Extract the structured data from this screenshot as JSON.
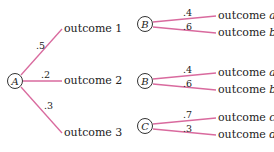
{
  "colors": {
    "branch": "#d96a9e",
    "text": "#222222",
    "node_border": "#333333"
  },
  "tree_A": {
    "node": "A",
    "branches": [
      {
        "prob": ".5",
        "outcome": "outcome 1"
      },
      {
        "prob": ".2",
        "outcome": "outcome 2"
      },
      {
        "prob": ".3",
        "outcome": "outcome 3"
      }
    ]
  },
  "tree_B1": {
    "node": "B",
    "branches": [
      {
        "prob": ".4",
        "outcome_prefix": "outcome",
        "outcome_var": "a"
      },
      {
        "prob": ".6",
        "outcome_prefix": "outcome",
        "outcome_var": "b"
      }
    ]
  },
  "tree_B2": {
    "node": "B",
    "branches": [
      {
        "prob": ".4",
        "outcome_prefix": "outcome",
        "outcome_var": "a"
      },
      {
        "prob": ".6",
        "outcome_prefix": "outcome",
        "outcome_var": "b"
      }
    ]
  },
  "tree_C": {
    "node": "C",
    "branches": [
      {
        "prob": ".7",
        "outcome_prefix": "outcome",
        "outcome_var": "c"
      },
      {
        "prob": ".3",
        "outcome_prefix": "outcome",
        "outcome_var": "d"
      }
    ]
  }
}
